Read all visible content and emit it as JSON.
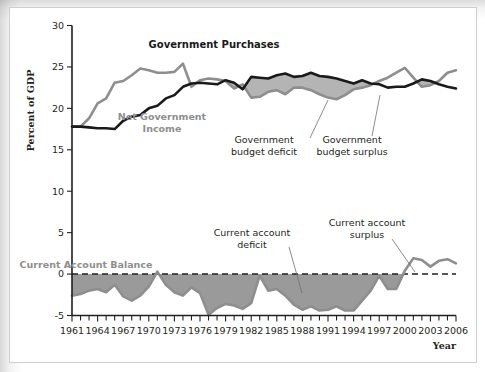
{
  "chart_data": {
    "type": "line",
    "title": "",
    "xlabel": "Year",
    "ylabel": "Percent of GDP",
    "xlim": [
      1961,
      2006
    ],
    "ylim": [
      -5,
      30
    ],
    "ytick_labels": [
      "30",
      "25",
      "20",
      "15",
      "10",
      "5",
      "0",
      "-5"
    ],
    "ytick_values": [
      30,
      25,
      20,
      15,
      10,
      5,
      0,
      -5
    ],
    "xtick_labels": [
      "1961",
      "1964",
      "1967",
      "1970",
      "1973",
      "1976",
      "1979",
      "1982",
      "1985",
      "1988",
      "1991",
      "1994",
      "1997",
      "2000",
      "2003",
      "2006"
    ],
    "xtick_values": [
      1961,
      1964,
      1967,
      1970,
      1973,
      1976,
      1979,
      1982,
      1985,
      1988,
      1991,
      1994,
      1997,
      2000,
      2003,
      2006
    ],
    "minor_tick_step": 1,
    "grid": false,
    "legend_position": "inline-annotations",
    "x": [
      1961,
      1962,
      1963,
      1964,
      1965,
      1966,
      1967,
      1968,
      1969,
      1970,
      1971,
      1972,
      1973,
      1974,
      1975,
      1976,
      1977,
      1978,
      1979,
      1980,
      1981,
      1982,
      1983,
      1984,
      1985,
      1986,
      1987,
      1988,
      1989,
      1990,
      1991,
      1992,
      1993,
      1994,
      1995,
      1996,
      1997,
      1998,
      1999,
      2000,
      2001,
      2002,
      2003,
      2004,
      2005,
      2006
    ],
    "series": [
      {
        "name": "Government Purchases",
        "color": "#1a1a1a",
        "style": "solid-thick-black",
        "values": [
          17.8,
          17.8,
          17.7,
          17.6,
          17.6,
          17.5,
          18.5,
          19.0,
          19.2,
          20.0,
          20.3,
          21.2,
          21.6,
          22.6,
          23.0,
          23.1,
          23.0,
          22.9,
          23.4,
          23.1,
          22.3,
          23.8,
          23.7,
          23.6,
          24.0,
          24.2,
          23.8,
          23.9,
          24.3,
          23.9,
          23.8,
          23.6,
          23.3,
          23.0,
          23.4,
          23.0,
          22.9,
          22.5,
          22.6,
          22.6,
          23.0,
          23.5,
          23.3,
          22.9,
          22.6,
          22.4
        ]
      },
      {
        "name": "Net Government Income",
        "color": "#8e8e8e",
        "style": "solid-thick-gray",
        "values": [
          17.8,
          17.8,
          18.8,
          20.6,
          21.2,
          23.1,
          23.3,
          24.0,
          24.8,
          24.6,
          24.3,
          24.3,
          24.4,
          25.4,
          22.6,
          23.4,
          23.6,
          23.5,
          23.3,
          22.4,
          22.9,
          21.3,
          21.4,
          22.0,
          22.2,
          21.7,
          22.5,
          22.5,
          22.2,
          21.7,
          21.3,
          21.1,
          21.6,
          22.3,
          22.5,
          22.8,
          23.3,
          23.7,
          24.3,
          24.9,
          23.7,
          22.6,
          22.8,
          23.3,
          24.3,
          24.6
        ]
      },
      {
        "name": "Current Account Balance",
        "color": "#8e8e8e",
        "style": "solid-thick-gray",
        "values": [
          -2.6,
          -2.4,
          -2.0,
          -1.8,
          -2.2,
          -1.3,
          -2.7,
          -3.2,
          -2.6,
          -1.5,
          0.3,
          -1.3,
          -2.2,
          -2.6,
          -1.6,
          -2.3,
          -4.9,
          -4.1,
          -3.6,
          -3.8,
          -4.2,
          -3.5,
          -0.2,
          -2.0,
          -1.8,
          -2.6,
          -3.7,
          -4.3,
          -3.9,
          -4.4,
          -4.3,
          -3.9,
          -4.4,
          -4.4,
          -3.2,
          -2.0,
          -0.2,
          -1.8,
          -1.8,
          0.4,
          1.9,
          1.7,
          0.9,
          1.6,
          1.8,
          1.3
        ]
      }
    ],
    "shaded_regions": [
      {
        "name": "Government budget deficit",
        "between": [
          "Net Government Income",
          "Government Purchases"
        ],
        "color": "#b4b4b4",
        "condition": "purchases above income"
      },
      {
        "name": "Government budget surplus",
        "between": [
          "Government Purchases",
          "Net Government Income"
        ],
        "color": "#ffffff",
        "condition": "income above purchases"
      },
      {
        "name": "Current account deficit",
        "between": [
          "Current Account Balance",
          "zero"
        ],
        "color": "#9a9a9a",
        "condition": "balance below zero"
      }
    ],
    "reference_lines": [
      {
        "name": "zero-line",
        "y": 0,
        "style": "dashed"
      }
    ],
    "annotations": [
      {
        "id": "government-purchases",
        "text": "Government Purchases",
        "style": "bold-black",
        "x": 214,
        "y": 48
      },
      {
        "id": "net-government-income",
        "text": "Net Government\nIncome",
        "line1": "Net Government",
        "line2": "Income",
        "style": "bold-gray",
        "x": 162,
        "y": 120
      },
      {
        "id": "government-budget-deficit",
        "text": "Government\nbudget deficit",
        "line1": "Government",
        "line2": "budget deficit",
        "style": "plain",
        "x": 264,
        "y": 143,
        "leader": {
          "x1": 310,
          "y1": 138,
          "x2": 328,
          "y2": 100
        }
      },
      {
        "id": "government-budget-surplus",
        "text": "Government\nbudget surplus",
        "line1": "Government",
        "line2": "budget surplus",
        "style": "plain",
        "x": 352,
        "y": 143,
        "leader": {
          "x1": 372,
          "y1": 136,
          "x2": 380,
          "y2": 95
        }
      },
      {
        "id": "current-account-balance",
        "text": "Current Account Balance",
        "style": "bold-gray",
        "x": 86,
        "y": 268
      },
      {
        "id": "current-account-deficit",
        "text": "Current account\ndeficit",
        "line1": "Current account",
        "line2": "deficit",
        "style": "plain",
        "x": 252,
        "y": 236,
        "leader": {
          "x1": 289,
          "y1": 247,
          "x2": 302,
          "y2": 293
        }
      },
      {
        "id": "current-account-surplus",
        "text": "Current account\nsurplus",
        "line1": "Current account",
        "line2": "surplus",
        "style": "plain",
        "x": 367,
        "y": 226,
        "leader": {
          "x1": 392,
          "y1": 239,
          "x2": 415,
          "y2": 272
        }
      }
    ]
  }
}
